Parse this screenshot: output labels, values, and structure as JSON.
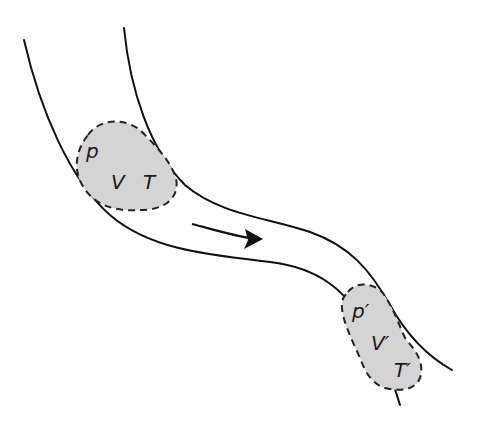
{
  "diagram": {
    "flow_direction": "left-to-right / downward",
    "colors": {
      "wall": "#111111",
      "parcel_fill": "#d4d4d4",
      "parcel_border": "#222222",
      "background": "#ffffff"
    },
    "parcel_initial": {
      "labels": {
        "pressure": "p",
        "volume": "V",
        "temperature": "T"
      }
    },
    "parcel_final": {
      "labels": {
        "pressure": "p′",
        "volume": "V′",
        "temperature": "T′"
      }
    },
    "arrow": {
      "meaning": "flow direction"
    }
  }
}
